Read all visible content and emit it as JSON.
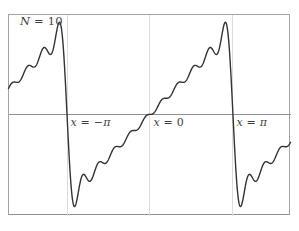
{
  "figure": {
    "annotation": {
      "text": "N = 10",
      "parts": [
        {
          "t": "N",
          "i": true
        },
        {
          "t": " = ",
          "i": false
        },
        {
          "t": "10",
          "i": false
        }
      ]
    }
  },
  "chart_data": {
    "type": "line",
    "annotation": "N = 10",
    "series": [
      {
        "name": "S_N(x), N = 10",
        "formula": "S_N(x) = 2 * sum_{n=1}^{N} (-1)^(n+1) * sin(n*x) / n",
        "N": 10,
        "amplitude_coefficient": 2
      }
    ],
    "underlying_function": "f(x) = x on (-pi, pi), extended 2pi-periodically (sawtooth)",
    "jump_discontinuities": [
      -3.14159265,
      3.14159265
    ],
    "gibbs_overshoot_peak": 3.7,
    "x_range": [
      -5.357,
      5.321
    ],
    "y_range": [
      -3.744,
      3.7
    ],
    "samples": 800,
    "gridlines_x": [
      -3.14159265,
      0,
      3.14159265
    ],
    "axis_y_value": 0,
    "legend": "none",
    "x_axis_labels": [
      {
        "text": "x = −π",
        "x_value": -3.14159265,
        "parts": [
          {
            "t": "x",
            "i": true
          },
          {
            "t": " = ",
            "i": false
          },
          {
            "t": "−",
            "i": false
          },
          {
            "t": "π",
            "i": true
          }
        ]
      },
      {
        "text": "x = 0",
        "x_value": 0,
        "parts": [
          {
            "t": "x",
            "i": true
          },
          {
            "t": " = ",
            "i": false
          },
          {
            "t": "0",
            "i": false
          }
        ]
      },
      {
        "text": "x = π",
        "x_value": 3.14159265,
        "parts": [
          {
            "t": "x",
            "i": true
          },
          {
            "t": " = ",
            "i": false
          },
          {
            "t": "π",
            "i": true
          }
        ]
      }
    ],
    "colors": {
      "curve": "#333333",
      "axis": "#8f8f8f",
      "gridline": "#dcdcdc",
      "frame": "#a5a5a5",
      "background": "#ffffff",
      "text": "#3f3f3f"
    }
  }
}
